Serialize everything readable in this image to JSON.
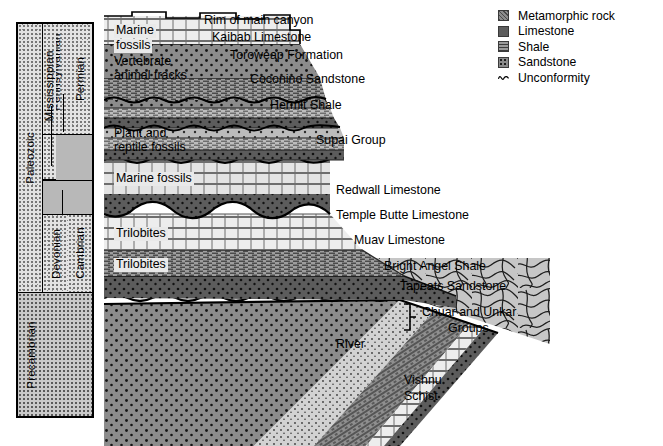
{
  "figure": {
    "background": "#ffffff"
  },
  "time_column": {
    "era_label": "Paleozoic",
    "precambrian_label": "Precambrian",
    "periods": [
      {
        "label": "Permian"
      },
      {
        "label": "Pennsylvanian"
      },
      {
        "label": "Mississippian"
      },
      {
        "label": "Devonian"
      },
      {
        "label": "Cambrian"
      }
    ]
  },
  "legend": {
    "items": [
      {
        "label": "Metamorphic rock",
        "swatch": "metamorphic-swatch",
        "color": "#8d8d8d"
      },
      {
        "label": "Limestone",
        "swatch": "limestone-swatch",
        "color": "#ededed"
      },
      {
        "label": "Shale",
        "swatch": "shale-swatch",
        "color": "#9b9b9b"
      },
      {
        "label": "Sandstone",
        "swatch": "sandstone-swatch",
        "color": "#8a8a8a"
      },
      {
        "label": "Unconformity",
        "swatch": "unconformity-wave-icon",
        "color": "#000000"
      }
    ]
  },
  "formation_labels": {
    "rim": "Rim of main canyon",
    "kaibab": "Kaibab Limestone",
    "toroweap": "Toroweap Formation",
    "coconino": "Coconino Sandstone",
    "hermit": "Hermit Shale",
    "supai": "Supai Group",
    "redwall": "Redwall Limestone",
    "temple_butte": "Temple Butte Limestone",
    "muav": "Muav Limestone",
    "bright_angel": "Bright Angel Shale",
    "tapeats": "Tapeats Sandstone",
    "chuar_unkar_l1": "Chuar and Unkar",
    "chuar_unkar_l2": "Groups",
    "river": "River",
    "vishnu_l1": "Vishnu",
    "vishnu_l2": "Schist"
  },
  "fossil_labels": {
    "marine_top_l1": "Marine",
    "marine_top_l2": "fossils",
    "vertebrate_l1": "Vertebrate",
    "vertebrate_l2": "animal tracks",
    "plant_l1": "Plant and",
    "plant_l2": "reptile fossils",
    "marine_mid": "Marine fossils",
    "trilobites_1": "Trilobites",
    "trilobites_2": "Trilobites"
  }
}
